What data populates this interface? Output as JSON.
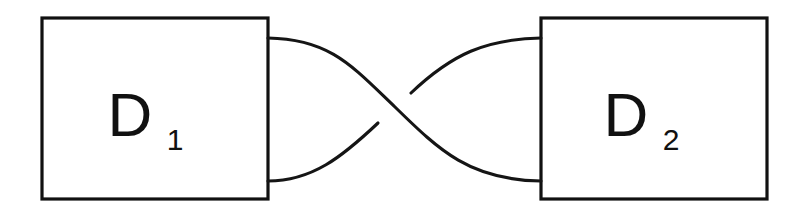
{
  "figure": {
    "kind": "tangle-crossing-diagram",
    "background_color": "#ffffff",
    "stroke_color": "#151515",
    "box_stroke_color": "#111111",
    "box_fill_color": "#ffffff",
    "width": 806,
    "height": 217
  },
  "boxes": [
    {
      "id": "D1",
      "label_base": "D",
      "label_subscript": "1",
      "x": 42,
      "y": 18,
      "width": 226,
      "height": 181,
      "label_x": 130,
      "label_y": 136,
      "sub_x": 175,
      "sub_y": 150
    },
    {
      "id": "D2",
      "label_base": "D",
      "label_subscript": "2",
      "x": 541,
      "y": 18,
      "width": 226,
      "height": 181,
      "label_x": 626,
      "label_y": 136,
      "sub_x": 671,
      "sub_y": 150
    }
  ],
  "strands": [
    {
      "id": "over-strand",
      "role": "over",
      "from_box": "D1",
      "from_port": "top-right",
      "to_box": "D2",
      "to_port": "bottom-left",
      "start": [
        268,
        38
      ],
      "end": [
        541,
        181
      ],
      "path": "M 268 38 C 330 39 352 66 395 107 C 440 151 470 180 541 181"
    },
    {
      "id": "under-strand-lower-left",
      "role": "under",
      "from_box": "D1",
      "from_port": "bottom-right",
      "to_crossing_break": [
        378,
        123
      ],
      "start": [
        268,
        181
      ],
      "path": "M 268 181 C 312 181 342 157 378 123"
    },
    {
      "id": "under-strand-upper-right",
      "role": "under",
      "from_crossing_break": [
        411,
        93
      ],
      "to_box": "D2",
      "to_port": "top-left",
      "end": [
        541,
        38
      ],
      "path": "M 411 93 C 452 54 486 39 541 38"
    }
  ],
  "crossing": {
    "id": "crossing-1",
    "center": [
      395,
      107
    ],
    "over_direction": "upper-left-to-lower-right",
    "under_direction": "lower-left-to-upper-right",
    "break_gap_start": [
      378,
      123
    ],
    "break_gap_end": [
      411,
      93
    ]
  }
}
